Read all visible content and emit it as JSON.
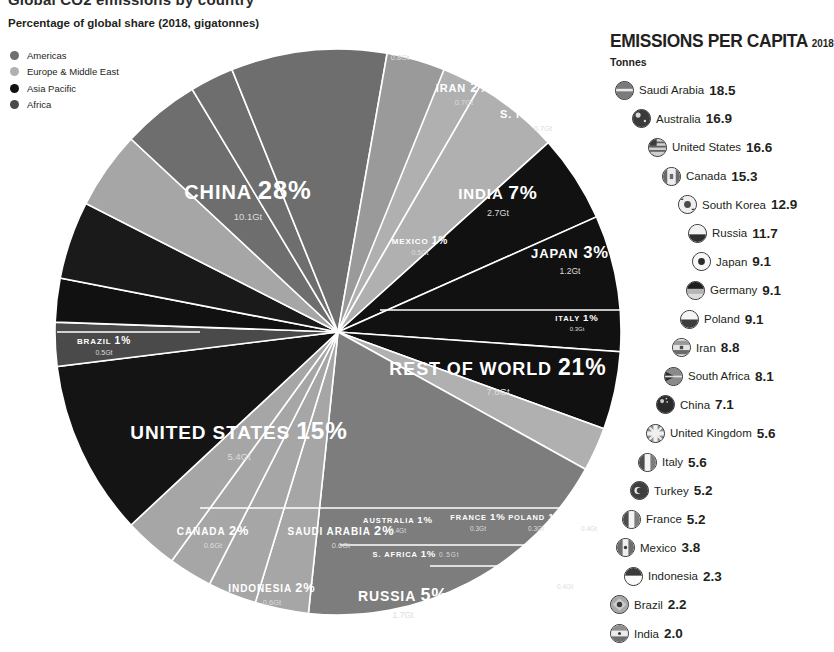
{
  "clipped_title": "Global CO2 emissions by country",
  "subtitle": "Percentage of global share (2018, gigatonnes)",
  "colors": {
    "americas": "#6e6e6e",
    "europe_middle_east": "#b0b0b0",
    "asia_pacific": "#111111",
    "africa": "#4a4a4a",
    "background": "#ffffff",
    "text": "#231f20",
    "slice_label": "#ffffff"
  },
  "legend": {
    "items": [
      {
        "label": "Americas",
        "color": "#6e6e6e"
      },
      {
        "label": "Europe & Middle East",
        "color": "#b0b0b0"
      },
      {
        "label": "Asia Pacific",
        "color": "#111111"
      },
      {
        "label": "Africa",
        "color": "#4a4a4a"
      }
    ]
  },
  "chart_data": {
    "type": "pie",
    "title": "Global CO2 emissions by country",
    "subtitle": "Percentage of global share (2018, gigatonnes)",
    "unit": "gigatonnes",
    "year": 2018,
    "legend_position": "top-left",
    "categories": [
      "Americas",
      "Europe & Middle East",
      "Asia Pacific",
      "Africa"
    ],
    "slices": [
      {
        "name": "CHINA",
        "percent": 28,
        "percent_label": "28%",
        "value": 10.1,
        "value_label": "10.1Gt",
        "region": "Asia Pacific",
        "color": "#111111"
      },
      {
        "name": "GERMANY",
        "percent": 2,
        "percent_label": "2%",
        "value": 0.8,
        "value_label": "0.8Gt",
        "region": "Europe & Middle East",
        "color": "#b0b0b0"
      },
      {
        "name": "IRAN",
        "percent": 2,
        "percent_label": "2%",
        "value": 0.7,
        "value_label": "0.7Gt",
        "region": "Europe & Middle East",
        "color": "#b0b0b0"
      },
      {
        "name": "S. KOREA",
        "percent": 2,
        "percent_label": "2%",
        "value": 0.7,
        "value_label": "0.7Gt",
        "region": "Asia Pacific",
        "color": "#111111"
      },
      {
        "name": "INDIA",
        "percent": 7,
        "percent_label": "7%",
        "value": 2.7,
        "value_label": "2.7Gt",
        "region": "Asia Pacific",
        "color": "#111111"
      },
      {
        "name": "JAPAN",
        "percent": 3,
        "percent_label": "3%",
        "value": 1.2,
        "value_label": "1.2Gt",
        "region": "Asia Pacific",
        "color": "#111111"
      },
      {
        "name": "ITALY",
        "percent": 1,
        "percent_label": "1%",
        "value": 0.3,
        "value_label": "0.3Gt",
        "region": "Europe & Middle East",
        "color": "#b0b0b0"
      },
      {
        "name": "REST OF WORLD",
        "percent": 21,
        "percent_label": "21%",
        "value": 7.6,
        "value_label": "7.6Gt",
        "region": "Europe & Middle East",
        "color": "#7d7d7d"
      },
      {
        "name": "MEXICO",
        "percent": 1,
        "percent_label": "1%",
        "value": 0.5,
        "value_label": "0.5Gt",
        "region": "Americas",
        "color": "#9a9a9a"
      },
      {
        "name": "BRAZIL",
        "percent": 1,
        "percent_label": "1%",
        "value": 0.5,
        "value_label": "0.5Gt",
        "region": "Americas",
        "color": "#6e6e6e"
      },
      {
        "name": "UNITED STATES",
        "percent": 15,
        "percent_label": "15%",
        "value": 5.4,
        "value_label": "5.4Gt",
        "region": "Americas",
        "color": "#6e6e6e"
      },
      {
        "name": "CANADA",
        "percent": 2,
        "percent_label": "2%",
        "value": 0.6,
        "value_label": "0.6Gt",
        "region": "Americas",
        "color": "#6e6e6e"
      },
      {
        "name": "SAUDI ARABIA",
        "percent": 2,
        "percent_label": "2%",
        "value": 0.6,
        "value_label": "0.6Gt",
        "region": "Europe & Middle East",
        "color": "#a6a6a6"
      },
      {
        "name": "INDONESIA",
        "percent": 2,
        "percent_label": "2%",
        "value": 0.6,
        "value_label": "0.6Gt",
        "region": "Asia Pacific",
        "color": "#1a1a1a"
      },
      {
        "name": "AUSTRALIA",
        "percent": 1,
        "percent_label": "1%",
        "value": 0.4,
        "value_label": "0.4Gt",
        "region": "Asia Pacific",
        "color": "#111111"
      },
      {
        "name": "S. AFRICA",
        "percent": 1,
        "percent_label": "1%",
        "value": 0.5,
        "value_label": "0.5Gt",
        "region": "Africa",
        "color": "#4a4a4a"
      },
      {
        "name": "RUSSIA",
        "percent": 5,
        "percent_label": "5%",
        "value": 1.7,
        "value_label": "1.7Gt",
        "region": "Asia Pacific",
        "color": "#141414"
      },
      {
        "name": "FRANCE",
        "percent": 1,
        "percent_label": "1%",
        "value": 0.3,
        "value_label": "0.3Gt",
        "region": "Europe & Middle East",
        "color": "#a6a6a6"
      },
      {
        "name": "POLAND",
        "percent": 1,
        "percent_label": "1%",
        "value": 0.3,
        "value_label": "0.3Gt",
        "region": "Europe & Middle East",
        "color": "#a6a6a6"
      },
      {
        "name": "TURKEY",
        "percent": 1,
        "percent_label": "1%",
        "value": 0.4,
        "value_label": "0.4Gt",
        "region": "Europe & Middle East",
        "color": "#a6a6a6"
      },
      {
        "name": "UK",
        "percent": 1,
        "percent_label": "1%",
        "value": 0.4,
        "value_label": "0.4Gt",
        "region": "Europe & Middle East",
        "color": "#a6a6a6"
      }
    ]
  },
  "percapita": {
    "title": "EMISSIONS PER CAPITA",
    "year": "2018",
    "unit": "Tonnes",
    "rows": [
      {
        "country": "Saudi Arabia",
        "value": "18.5",
        "flag": "flag-saudi-arabia-icon"
      },
      {
        "country": "Australia",
        "value": "16.9",
        "flag": "flag-australia-icon"
      },
      {
        "country": "United States",
        "value": "16.6",
        "flag": "flag-united-states-icon"
      },
      {
        "country": "Canada",
        "value": "15.3",
        "flag": "flag-canada-icon"
      },
      {
        "country": "South Korea",
        "value": "12.9",
        "flag": "flag-south-korea-icon"
      },
      {
        "country": "Russia",
        "value": "11.7",
        "flag": "flag-russia-icon"
      },
      {
        "country": "Japan",
        "value": "9.1",
        "flag": "flag-japan-icon"
      },
      {
        "country": "Germany",
        "value": "9.1",
        "flag": "flag-germany-icon"
      },
      {
        "country": "Poland",
        "value": "9.1",
        "flag": "flag-poland-icon"
      },
      {
        "country": "Iran",
        "value": "8.8",
        "flag": "flag-iran-icon"
      },
      {
        "country": "South Africa",
        "value": "8.1",
        "flag": "flag-south-africa-icon"
      },
      {
        "country": "China",
        "value": "7.1",
        "flag": "flag-china-icon"
      },
      {
        "country": "United Kingdom",
        "value": "5.6",
        "flag": "flag-united-kingdom-icon"
      },
      {
        "country": "Italy",
        "value": "5.6",
        "flag": "flag-italy-icon"
      },
      {
        "country": "Turkey",
        "value": "5.2",
        "flag": "flag-turkey-icon"
      },
      {
        "country": "France",
        "value": "5.2",
        "flag": "flag-france-icon"
      },
      {
        "country": "Mexico",
        "value": "3.8",
        "flag": "flag-mexico-icon"
      },
      {
        "country": "Indonesia",
        "value": "2.3",
        "flag": "flag-indonesia-icon"
      },
      {
        "country": "Brazil",
        "value": "2.2",
        "flag": "flag-brazil-icon"
      },
      {
        "country": "India",
        "value": "2.0",
        "flag": "flag-india-icon"
      }
    ]
  }
}
